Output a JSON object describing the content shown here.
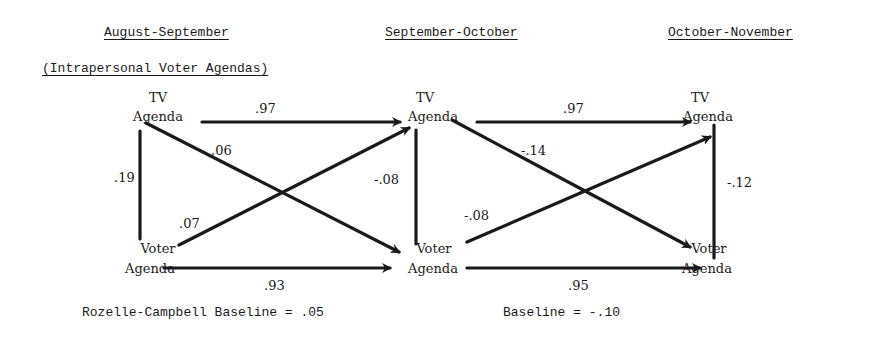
{
  "headers": {
    "period1": "August-September",
    "period2": "September-October",
    "period3": "October-November",
    "subtitle": "(Intrapersonal Voter Agendas)"
  },
  "nodes": {
    "tv1": {
      "line1": "TV",
      "line2": "Agenda"
    },
    "voter1": {
      "line1": "Voter",
      "line2": "Agenda"
    },
    "tv2": {
      "line1": "TV",
      "line2": "Agenda"
    },
    "voter2": {
      "line1": "Voter",
      "line2": "Agenda"
    },
    "tv3": {
      "line1": "TV",
      "line2": "Agenda"
    },
    "voter3": {
      "line1": "Voter",
      "line2": "Agenda"
    }
  },
  "coefficients": {
    "tv1_tv2": ".97",
    "tv1_voter2": ".06",
    "voter1_tv2": ".07",
    "voter1_voter2": ".93",
    "tv1_voter1": ".19",
    "tv2_voter2": "-.08",
    "tv2_tv3": ".97",
    "tv2_voter3": "-.14",
    "voter2_tv3": "-.08",
    "voter2_voter3": ".95",
    "tv3_voter3": "-.12"
  },
  "baselines": {
    "first": "Rozelle-Campbell Baseline = .05",
    "second": "Baseline = -.10"
  },
  "colors": {
    "ink": "#1a1a1a",
    "background": "#ffffff"
  }
}
